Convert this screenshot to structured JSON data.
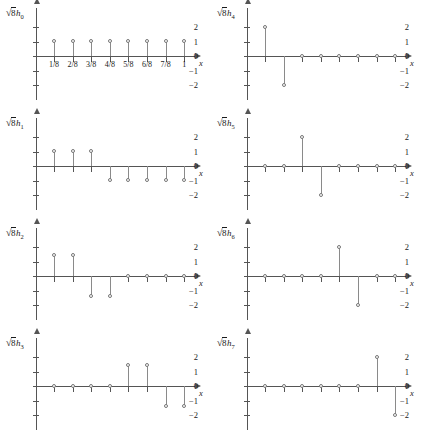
{
  "figure": {
    "title": "",
    "panel_count": 8,
    "x_axis_label": "x",
    "x_tick_labels": [
      "1/8",
      "2/8",
      "3/8",
      "4/8",
      "5/8",
      "6/8",
      "7/8",
      "1"
    ],
    "y_tick_labels": [
      "2",
      "1",
      "0",
      "−1",
      "−2"
    ],
    "y_tick_values": [
      2,
      1,
      0,
      -1,
      -2
    ],
    "marker_style": "open-circle",
    "stem_color": "#8a8a8a",
    "axis_color": "#555555"
  },
  "chart_data": {
    "type": "scatter",
    "title": "",
    "xlabel": "x",
    "ylabel": "",
    "ylim": [
      -2.6,
      2.6
    ],
    "xlim": [
      0,
      1.08
    ],
    "grid": false,
    "legend": "none",
    "x": [
      0.125,
      0.25,
      0.375,
      0.5,
      0.625,
      0.75,
      0.875,
      1.0
    ],
    "x_tick_labels": [
      "1/8",
      "2/8",
      "3/8",
      "4/8",
      "5/8",
      "6/8",
      "7/8",
      "1"
    ],
    "y_ticks": [
      2,
      1,
      0,
      -1,
      -2
    ],
    "series": [
      {
        "name": "√8h₀",
        "label_root": "8",
        "label_sub": "0",
        "values": [
          1,
          1,
          1,
          1,
          1,
          1,
          1,
          1
        ],
        "show_x_tick_labels": true
      },
      {
        "name": "√8h₄",
        "label_root": "8",
        "label_sub": "4",
        "values": [
          2,
          -2,
          0,
          0,
          0,
          0,
          0,
          0
        ],
        "show_x_tick_labels": false
      },
      {
        "name": "√8h₁",
        "label_root": "8",
        "label_sub": "1",
        "values": [
          1,
          1,
          1,
          -1,
          -1,
          -1,
          -1,
          -1
        ],
        "show_x_tick_labels": false
      },
      {
        "name": "√8h₅",
        "label_root": "8",
        "label_sub": "5",
        "values": [
          0,
          0,
          2,
          -2,
          0,
          0,
          0,
          0
        ],
        "show_x_tick_labels": false
      },
      {
        "name": "√8h₂",
        "label_root": "8",
        "label_sub": "2",
        "values": [
          1.41,
          1.41,
          -1.41,
          -1.41,
          0,
          0,
          0,
          0
        ],
        "show_x_tick_labels": false
      },
      {
        "name": "√8h₆",
        "label_root": "8",
        "label_sub": "6",
        "values": [
          0,
          0,
          0,
          0,
          2,
          -2,
          0,
          0
        ],
        "show_x_tick_labels": false
      },
      {
        "name": "√8h₃",
        "label_root": "8",
        "label_sub": "3",
        "values": [
          0,
          0,
          0,
          0,
          1.41,
          1.41,
          -1.41,
          -1.41
        ],
        "show_x_tick_labels": false
      },
      {
        "name": "√8h₇",
        "label_root": "8",
        "label_sub": "7",
        "values": [
          0,
          0,
          0,
          0,
          0,
          0,
          2,
          -2
        ],
        "show_x_tick_labels": false
      }
    ]
  }
}
